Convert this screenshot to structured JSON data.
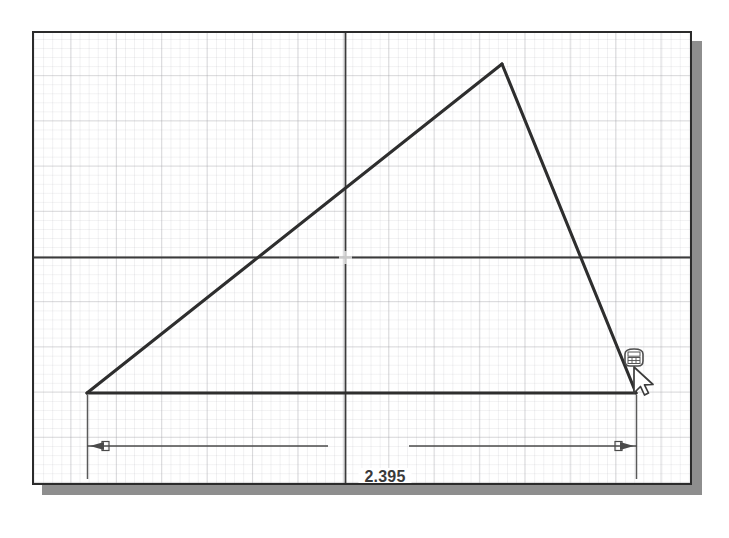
{
  "app": {
    "name": "cad-sketch-viewport",
    "background_color": "#ffffff"
  },
  "window": {
    "border_color": "#2b2b2b",
    "shadow_color": "#8e8e8e",
    "canvas_color": "#ffffff"
  },
  "grid": {
    "visible": true,
    "major_color": "#96969b",
    "minor_color": "#a0a0a8",
    "major_spacing_px": 45
  },
  "axes": {
    "horizontal_label": "horizontal-reference-axis",
    "vertical_label": "vertical-reference-axis",
    "color": "#3b3b3b",
    "origin_marker": "cross"
  },
  "sketch": {
    "name": "triangle-profile",
    "line_color": "#2e2e2e",
    "vertices": [
      {
        "name": "bottom-left-vertex",
        "x": 53,
        "y": 360
      },
      {
        "name": "apex-vertex",
        "x": 468,
        "y": 31
      },
      {
        "name": "bottom-right-vertex",
        "x": 602,
        "y": 360
      }
    ]
  },
  "dimension": {
    "name": "horizontal-linear-dimension",
    "value": "2.395",
    "units": "in",
    "arrow_style": "outward",
    "color": "#4a4a4a",
    "extension_line_color": "#5a5a5a"
  },
  "cursor": {
    "name": "smart-dimension-cursor",
    "badge_icon": "dimension-tool-icon",
    "pointer_icon": "arrow-pointer-icon",
    "x": 634,
    "y": 391
  }
}
